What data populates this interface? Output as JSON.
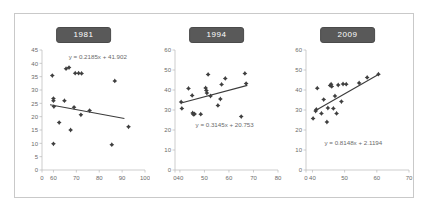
{
  "figure": {
    "background_color": "#ffffff",
    "border_color": "#c9c9c9",
    "marker_color": "#3f3f3f",
    "trend_color": "#3b3b3b",
    "axis_color": "#b7b7b7",
    "title_badge_color": "#595959",
    "title_text_color": "#ffffff",
    "label_color": "#6a6a6a"
  },
  "chart_data": [
    {
      "type": "scatter",
      "title": "1981",
      "xlabel": "",
      "ylabel": "",
      "grid": false,
      "legend": "none",
      "xlim": [
        55,
        100
      ],
      "ylim": [
        0,
        45
      ],
      "xticks": [
        0,
        60,
        70,
        80,
        90,
        100
      ],
      "xticklabels": [
        "0",
        "60",
        "70",
        "80",
        "90",
        "100"
      ],
      "yticks": [
        0,
        5,
        10,
        15,
        20,
        25,
        30,
        35,
        40,
        45
      ],
      "yticklabels": [
        "0",
        "5",
        "10",
        "15",
        "20",
        "25",
        "30",
        "35",
        "40",
        "45"
      ],
      "annotation": "y = 0.2185x + 41.902",
      "trendline": {
        "x": [
          58.5,
          91
        ],
        "y": [
          24.5,
          19.3
        ]
      },
      "points": [
        {
          "x": 59.5,
          "y": 35.4
        },
        {
          "x": 60.0,
          "y": 26.8
        },
        {
          "x": 60.0,
          "y": 26.0
        },
        {
          "x": 60.2,
          "y": 23.8
        },
        {
          "x": 60.0,
          "y": 9.8
        },
        {
          "x": 62.5,
          "y": 17.8
        },
        {
          "x": 64.8,
          "y": 26.0
        },
        {
          "x": 65.5,
          "y": 38.0
        },
        {
          "x": 66.8,
          "y": 38.4
        },
        {
          "x": 67.5,
          "y": 15.0
        },
        {
          "x": 69.0,
          "y": 23.5
        },
        {
          "x": 69.5,
          "y": 36.3
        },
        {
          "x": 71.0,
          "y": 36.3
        },
        {
          "x": 72.3,
          "y": 36.2
        },
        {
          "x": 72.0,
          "y": 20.7
        },
        {
          "x": 75.8,
          "y": 22.3
        },
        {
          "x": 85.5,
          "y": 9.5
        },
        {
          "x": 86.8,
          "y": 33.4
        },
        {
          "x": 92.8,
          "y": 16.2
        }
      ]
    },
    {
      "type": "scatter",
      "title": "1994",
      "xlabel": "",
      "ylabel": "",
      "grid": false,
      "legend": "none",
      "xlim": [
        38,
        80
      ],
      "ylim": [
        0,
        60
      ],
      "xticks": [
        0,
        40,
        50,
        60,
        70,
        80
      ],
      "xticklabels": [
        "0",
        "40",
        "50",
        "60",
        "70",
        "80"
      ],
      "yticks": [
        0,
        10,
        20,
        30,
        40,
        50,
        60
      ],
      "yticklabels": [
        "0",
        "10",
        "20",
        "30",
        "40",
        "50",
        "60"
      ],
      "annotation": "y = 0.3145x + 20.753",
      "trendline": {
        "x": [
          40.5,
          67.5
        ],
        "y": [
          33.5,
          42.3
        ]
      },
      "points": [
        {
          "x": 40.5,
          "y": 34.0
        },
        {
          "x": 40.8,
          "y": 30.8
        },
        {
          "x": 43.5,
          "y": 40.8
        },
        {
          "x": 45.0,
          "y": 37.3
        },
        {
          "x": 45.2,
          "y": 28.5
        },
        {
          "x": 45.5,
          "y": 27.8
        },
        {
          "x": 46.0,
          "y": 28.0
        },
        {
          "x": 48.5,
          "y": 27.9
        },
        {
          "x": 50.5,
          "y": 41.0
        },
        {
          "x": 50.8,
          "y": 39.8
        },
        {
          "x": 51.0,
          "y": 38.5
        },
        {
          "x": 51.5,
          "y": 47.8
        },
        {
          "x": 52.5,
          "y": 37.0
        },
        {
          "x": 55.5,
          "y": 32.3
        },
        {
          "x": 56.5,
          "y": 35.5
        },
        {
          "x": 57.0,
          "y": 42.8
        },
        {
          "x": 58.5,
          "y": 45.8
        },
        {
          "x": 65.0,
          "y": 26.7
        },
        {
          "x": 66.5,
          "y": 48.3
        },
        {
          "x": 67.0,
          "y": 43.2
        }
      ]
    },
    {
      "type": "scatter",
      "title": "2009",
      "xlabel": "",
      "ylabel": "",
      "grid": false,
      "legend": "none",
      "xlim": [
        38,
        70
      ],
      "ylim": [
        0,
        60
      ],
      "xticks": [
        0,
        40,
        50,
        60,
        70
      ],
      "xticklabels": [
        "0",
        "40",
        "50",
        "60",
        "70"
      ],
      "yticks": [
        0,
        10,
        20,
        30,
        40,
        50,
        60
      ],
      "yticklabels": [
        "0",
        "10",
        "20",
        "30",
        "40",
        "50",
        "60"
      ],
      "annotation": "y = 0.8148x + 2.1194",
      "trendline": {
        "x": [
          41.5,
          60.5
        ],
        "y": [
          30.2,
          47.8
        ]
      },
      "points": [
        {
          "x": 40.2,
          "y": 25.8
        },
        {
          "x": 41.0,
          "y": 29.5
        },
        {
          "x": 41.2,
          "y": 30.3
        },
        {
          "x": 41.5,
          "y": 40.9
        },
        {
          "x": 42.8,
          "y": 28.3
        },
        {
          "x": 43.5,
          "y": 35.2
        },
        {
          "x": 44.5,
          "y": 24.0
        },
        {
          "x": 44.8,
          "y": 31.0
        },
        {
          "x": 45.5,
          "y": 42.3
        },
        {
          "x": 45.8,
          "y": 42.9
        },
        {
          "x": 46.0,
          "y": 41.8
        },
        {
          "x": 46.5,
          "y": 30.8
        },
        {
          "x": 47.0,
          "y": 37.0
        },
        {
          "x": 47.5,
          "y": 28.3
        },
        {
          "x": 48.0,
          "y": 42.5
        },
        {
          "x": 49.0,
          "y": 34.2
        },
        {
          "x": 49.5,
          "y": 43.0
        },
        {
          "x": 50.5,
          "y": 42.9
        },
        {
          "x": 54.5,
          "y": 43.5
        },
        {
          "x": 57.0,
          "y": 46.3
        },
        {
          "x": 60.5,
          "y": 47.9
        }
      ]
    }
  ]
}
